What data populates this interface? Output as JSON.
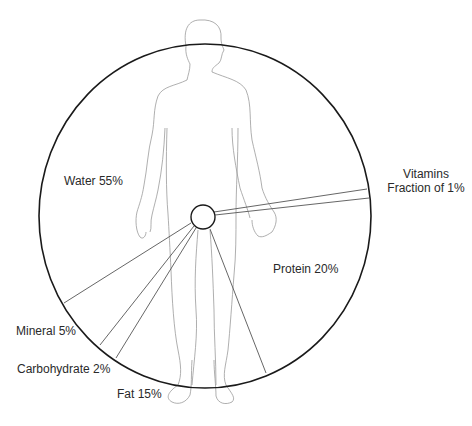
{
  "diagram": {
    "segments": [
      {
        "name": "Water",
        "label": "Water  55%",
        "percent": 55
      },
      {
        "name": "Protein",
        "label": "Protein 20%",
        "percent": 20
      },
      {
        "name": "Fat",
        "label": "Fat 15%",
        "percent": 15
      },
      {
        "name": "Mineral",
        "label": "Mineral 5%",
        "percent": 5
      },
      {
        "name": "Carbohydrate",
        "label": "Carbohydrate 2%",
        "percent": 2
      },
      {
        "name": "Vitamins",
        "label_line1": "Vitamins",
        "label_line2": "Fraction of 1%",
        "percent": "<1"
      }
    ],
    "colors": {
      "outline": "#1a1a1a",
      "body": "#8a8a8a",
      "divider": "#555555",
      "text": "#2a2a2a"
    }
  }
}
